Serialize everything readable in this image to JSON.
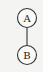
{
  "diagram": {
    "type": "tree",
    "nodes": [
      {
        "id": "A",
        "label": "A",
        "cx": 27,
        "cy": 18,
        "r": 9.5
      },
      {
        "id": "B",
        "label": "B",
        "cx": 27,
        "cy": 55,
        "r": 9.5
      }
    ],
    "edges": [
      {
        "from": "A",
        "to": "B"
      }
    ]
  }
}
